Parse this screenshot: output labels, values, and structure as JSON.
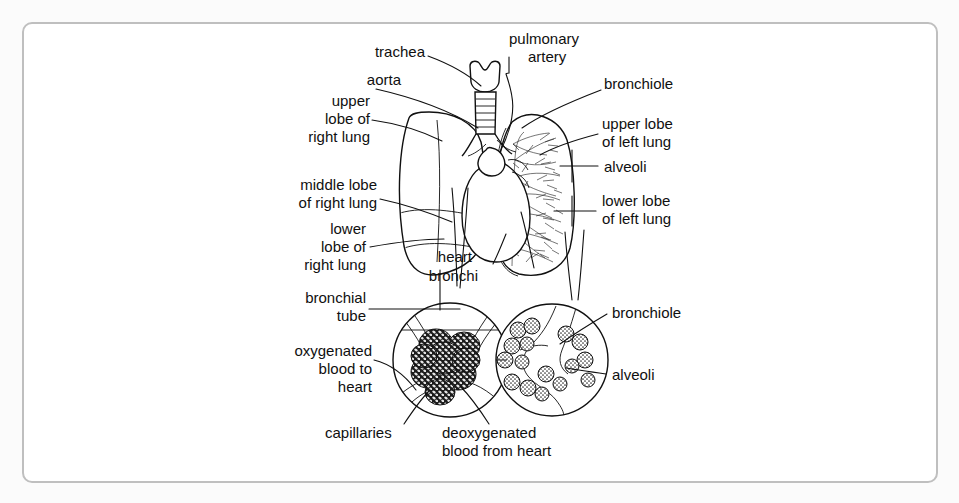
{
  "document": {
    "type": "anatomical-diagram",
    "subject": "Human respiratory system",
    "background_color": "#fbfbfb",
    "frame_color": "#bfbfbf",
    "ink_color": "#101010"
  },
  "labels": {
    "trachea": "trachea",
    "aorta": "aorta",
    "upper_lobe_right_1": "upper",
    "upper_lobe_right_2": "lobe of",
    "upper_lobe_right_3": "right lung",
    "middle_lobe_right_1": "middle lobe",
    "middle_lobe_right_2": "of right lung",
    "lower_lobe_right_1": "lower",
    "lower_lobe_right_2": "lobe of",
    "lower_lobe_right_3": "right lung",
    "bronchial_tube_1": "bronchial",
    "bronchial_tube_2": "tube",
    "oxygenated_1": "oxygenated",
    "oxygenated_2": "blood to",
    "oxygenated_3": "heart",
    "capillaries": "capillaries",
    "deoxygenated_1": "deoxygenated",
    "deoxygenated_2": "blood from heart",
    "pulmonary_artery_1": "pulmonary",
    "pulmonary_artery_2": "artery",
    "bronchiole_top": "bronchiole",
    "upper_lobe_left_1": "upper lobe",
    "upper_lobe_left_2": "of left lung",
    "alveoli_top": "alveoli",
    "lower_lobe_left_1": "lower lobe",
    "lower_lobe_left_2": "of left lung",
    "heart": "heart",
    "bronchi": "bronchi",
    "bronchiole_inset": "bronchiole",
    "alveoli_inset": "alveoli"
  },
  "structures": {
    "right_lung": "stippled right lung with upper, middle and lower lobes",
    "left_lung": "left lung showing branching bronchial tree",
    "heart": "heart outline between the lungs",
    "trachea": "larynx and ringed trachea",
    "inset_left": "capillary network around alveolus",
    "inset_right": "bronchiole with alveolar clusters"
  }
}
